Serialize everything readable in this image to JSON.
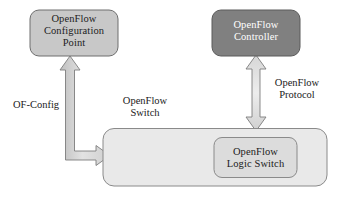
{
  "diagram": {
    "background_color": "#ffffff",
    "nodes": {
      "config_point": {
        "label": "OpenFlow\nConfiguration\nPoint",
        "fill_color": "#c8c8c8",
        "text_color": "#1c1c1c"
      },
      "controller": {
        "label": "OpenFlow\nController",
        "fill_color": "#808080",
        "text_color": "#ffffff"
      },
      "switch": {
        "label": "OpenFlow\nSwitch",
        "fill_color": "#e9e9e9",
        "text_color": "#1a1a1a"
      },
      "logic_switch": {
        "label": "OpenFlow\nLogic Switch",
        "fill_color": "#dcdcdc",
        "text_color": "#1a1a1a"
      }
    },
    "connections": {
      "of_config": {
        "label": "OF-Config",
        "from": "OpenFlow Switch",
        "to": "OpenFlow Configuration Point",
        "style": "double-headed-elbow-arrow",
        "fill_color": "#d0d0d0"
      },
      "openflow_protocol": {
        "label": "OpenFlow\nProtocol",
        "from": "OpenFlow Switch",
        "to": "OpenFlow Controller",
        "style": "double-headed-vertical-arrow",
        "fill_color": "#d8d8d8"
      }
    }
  }
}
